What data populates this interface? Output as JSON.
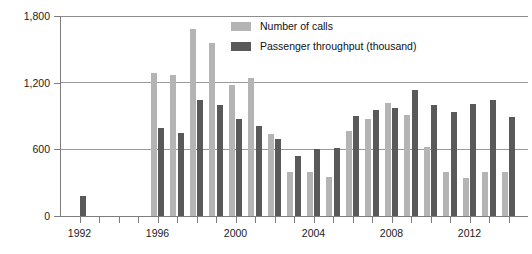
{
  "chart_data": {
    "type": "bar",
    "title": "",
    "xlabel": "",
    "ylabel": "",
    "ylim": [
      0,
      1800
    ],
    "yticks": [
      0,
      600,
      1200,
      1800
    ],
    "ytick_labels": [
      "0",
      "600",
      "1,200",
      "1,800"
    ],
    "grid": true,
    "legend_position": "top-center",
    "categories": [
      "1992",
      "1993",
      "1994",
      "1995",
      "1996",
      "1997",
      "1998",
      "1999",
      "2000",
      "2001",
      "2002",
      "2003",
      "2004",
      "2005",
      "2006",
      "2007",
      "2008",
      "2009",
      "2010",
      "2011",
      "2012",
      "2013",
      "2014"
    ],
    "xtick_labels": [
      "1992",
      "1996",
      "2000",
      "2004",
      "2008",
      "2012"
    ],
    "series": [
      {
        "name": "Number of calls",
        "color": "#b4b4b4",
        "values": [
          null,
          null,
          null,
          null,
          1285,
          1265,
          1680,
          1560,
          1180,
          1240,
          740,
          400,
          400,
          355,
          765,
          875,
          1015,
          910,
          620,
          400,
          345,
          400,
          395
        ]
      },
      {
        "name": "Passenger throughput (thousand)",
        "color": "#595959",
        "values": [
          180,
          null,
          null,
          null,
          790,
          745,
          1045,
          1000,
          870,
          810,
          690,
          540,
          600,
          615,
          900,
          955,
          975,
          1130,
          1000,
          940,
          1010,
          1040,
          890
        ]
      }
    ]
  },
  "legend": {
    "items": [
      {
        "label": "Number of calls",
        "swatch": "light"
      },
      {
        "label": "Passenger throughput (thousand)",
        "swatch": "dark"
      }
    ]
  }
}
